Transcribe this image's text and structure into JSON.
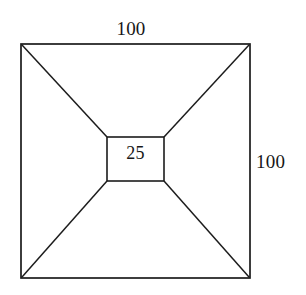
{
  "figure": {
    "name": "square-frustum-top-view",
    "background_color": "#ffffff",
    "stroke_color": "#1c1c1c",
    "stroke_width": 1.6,
    "labels": {
      "top_side": "100",
      "right_side": "100",
      "inner_square": "25"
    },
    "geometry": {
      "outer_square": {
        "x": 21,
        "y": 44,
        "width": 229,
        "height": 234
      },
      "inner_square": {
        "x": 107,
        "y": 137,
        "width": 57,
        "height": 44
      },
      "diagonals": [
        {
          "name": "top-left-diagonal",
          "x1": 21,
          "y1": 44,
          "x2": 107,
          "y2": 137
        },
        {
          "name": "top-right-diagonal",
          "x1": 250,
          "y1": 44,
          "x2": 164,
          "y2": 137
        },
        {
          "name": "bottom-left-diagonal",
          "x1": 21,
          "y1": 278,
          "x2": 107,
          "y2": 181
        },
        {
          "name": "bottom-right-diagonal",
          "x1": 250,
          "y1": 278,
          "x2": 164,
          "y2": 181
        }
      ]
    }
  }
}
